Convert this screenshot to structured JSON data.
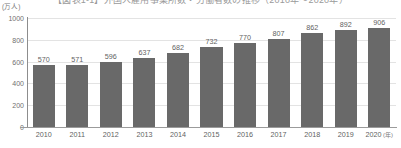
{
  "chart_data": {
    "type": "bar",
    "title": "【図表1-1】外国人雇用事業所数・労働者数の推移（2010年～2020年）",
    "subtitle": "",
    "xlabel": "年",
    "ylabel": "(万人)",
    "yunit": "(万人)",
    "xunit": "(年)",
    "categories": [
      "2010",
      "2011",
      "2012",
      "2013",
      "2014",
      "2015",
      "2016",
      "2017",
      "2018",
      "2019",
      "2020"
    ],
    "values": [
      570,
      571,
      596,
      637,
      682,
      732,
      770,
      807,
      862,
      892,
      906
    ],
    "value_labels": [
      "570",
      "571",
      "596",
      "637",
      "682",
      "732",
      "770",
      "807",
      "862",
      "892",
      "906"
    ],
    "ylim": [
      0,
      1000
    ],
    "yticks": [
      1000,
      800,
      600,
      400,
      200,
      0
    ],
    "ytick_labels": [
      "1000",
      "800",
      "600",
      "400",
      "200",
      "0"
    ],
    "grid": true,
    "legend": "none",
    "series": [
      {
        "name": "労働者数",
        "values": [
          570,
          571,
          596,
          637,
          682,
          732,
          770,
          807,
          862,
          892,
          906
        ]
      }
    ],
    "colors": {
      "bar": "#696969",
      "grid": "#e3e3e3",
      "axis": "#9b9b9b",
      "text": "#5f5f5f",
      "background": "#ffffff"
    }
  }
}
